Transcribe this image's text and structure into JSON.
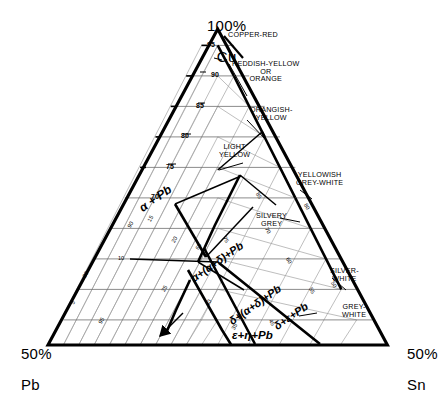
{
  "diagram": {
    "kind": "ternary-phase-diagram",
    "system": "Cu-Pb-Sn",
    "corners": {
      "top": {
        "value": "100%",
        "element": "Cu"
      },
      "bottom_left": {
        "value": "50%",
        "element": "Pb"
      },
      "bottom_right": {
        "value": "50%",
        "element": "Sn"
      }
    }
  },
  "axis_ticks": {
    "cu_major": [
      "95",
      "90",
      "85",
      "80",
      "75",
      "70"
    ],
    "minor": [
      "5",
      "10",
      "15",
      "20",
      "25",
      "30",
      "35",
      "40",
      "45",
      "50",
      "55",
      "60",
      "65",
      "70",
      "75",
      "80",
      "85",
      "90",
      "95"
    ]
  },
  "color_labels": [
    {
      "id": "copper-red",
      "text": "COPPER-RED"
    },
    {
      "id": "reddish-yellow",
      "text": "REDDISH-YELLOW\nOR\nORANGE"
    },
    {
      "id": "orangish-yellow",
      "text": "ORANGISH-\nYELLOW"
    },
    {
      "id": "light-yellow",
      "text": "LIGHT\nYELLOW"
    },
    {
      "id": "yellowish-grey-white",
      "text": "YELLOWISH\nGREY-WHITE"
    },
    {
      "id": "silvery-grey",
      "text": "SILVERY\nGREY"
    },
    {
      "id": "silver-white",
      "text": "SILVER-\nWHITE"
    },
    {
      "id": "grey-white",
      "text": "GREY-\nWHITE"
    }
  ],
  "phase_fields": [
    {
      "id": "alpha-pb",
      "text": "α + Pb"
    },
    {
      "id": "alpha-alphadelta-pb",
      "text": "α+(α+δ)+Pb"
    },
    {
      "id": "delta-alphadelta-pb",
      "text": "δ+(α+δ)+Pb"
    },
    {
      "id": "delta-epsilon-pb",
      "text": "δ+ε+Pb"
    },
    {
      "id": "epsilon-eta-pb",
      "text": "ε+η+Pb"
    }
  ],
  "style_colors": {
    "ink": "#000000",
    "grid": "#8d8d8d",
    "grid_light": "#a8a8a8",
    "background": "#ffffff"
  }
}
